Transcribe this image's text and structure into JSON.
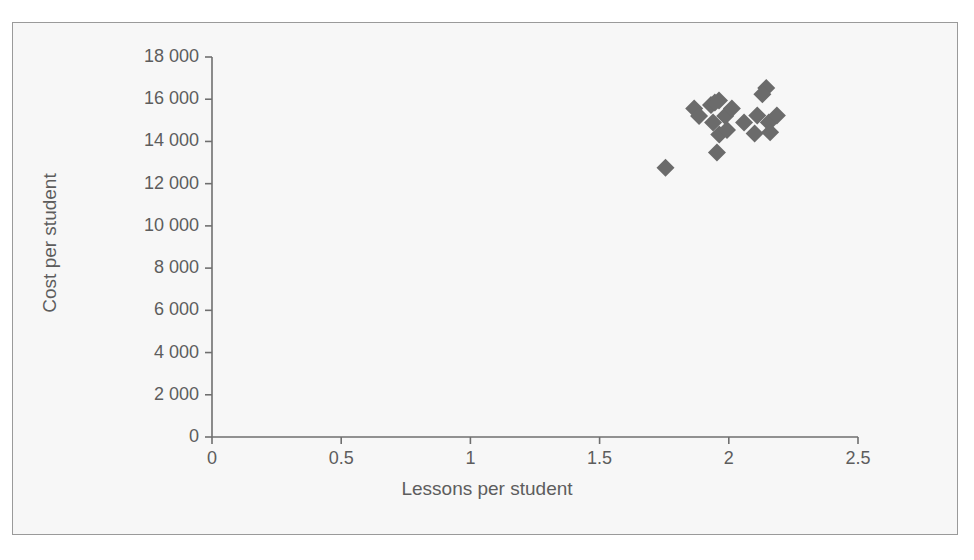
{
  "figure": {
    "top_caption_fragment": "",
    "background_color": "#f7f7f7",
    "frame_color": "#9a9a9a",
    "axis_color": "#6f6f6f",
    "marker_color": "#6b6b6b",
    "text_color": "#5d5d5d"
  },
  "chart_data": {
    "type": "scatter",
    "title": "",
    "xlabel": "Lessons per student",
    "ylabel": "Cost per student",
    "xlim": [
      0,
      2.5
    ],
    "ylim": [
      0,
      18000
    ],
    "grid": false,
    "legend": null,
    "xticks": [
      0,
      0.5,
      1,
      1.5,
      2,
      2.5
    ],
    "xtick_labels": [
      "0",
      "0.5",
      "1",
      "1.5",
      "2",
      "2.5"
    ],
    "yticks": [
      0,
      2000,
      4000,
      6000,
      8000,
      10000,
      12000,
      14000,
      16000,
      18000
    ],
    "ytick_labels": [
      "0",
      "2 000",
      "4 000",
      "6 000",
      "8 000",
      "10 000",
      "12 000",
      "14 000",
      "16 000",
      "18 000"
    ],
    "marker": "diamond",
    "marker_size": 9,
    "series": [
      {
        "name": "Schools",
        "color": "#6b6b6b",
        "points": [
          {
            "x": 1.755,
            "y": 12750
          },
          {
            "x": 1.866,
            "y": 15560
          },
          {
            "x": 1.885,
            "y": 15200
          },
          {
            "x": 1.931,
            "y": 15730
          },
          {
            "x": 1.946,
            "y": 15840
          },
          {
            "x": 1.962,
            "y": 15940
          },
          {
            "x": 1.939,
            "y": 14900
          },
          {
            "x": 1.986,
            "y": 15200
          },
          {
            "x": 2.012,
            "y": 15560
          },
          {
            "x": 1.963,
            "y": 14330
          },
          {
            "x": 1.993,
            "y": 14540
          },
          {
            "x": 1.954,
            "y": 13480
          },
          {
            "x": 2.059,
            "y": 14900
          },
          {
            "x": 2.11,
            "y": 15230
          },
          {
            "x": 2.1,
            "y": 14380
          },
          {
            "x": 2.145,
            "y": 16530
          },
          {
            "x": 2.13,
            "y": 16240
          },
          {
            "x": 2.155,
            "y": 14900
          },
          {
            "x": 2.16,
            "y": 14430
          },
          {
            "x": 2.186,
            "y": 15230
          }
        ]
      }
    ]
  },
  "axis_geometry": {
    "x_pixel_min": 212,
    "x_pixel_max": 858,
    "y_pixel_min": 437,
    "y_pixel_max": 57
  }
}
